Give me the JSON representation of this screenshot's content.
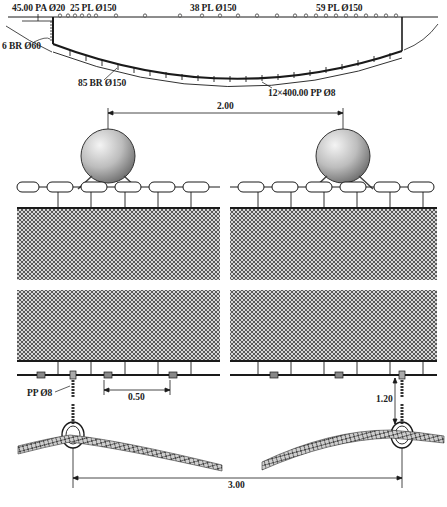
{
  "overview": {
    "headline_label": "45.00 PA Ø20",
    "float_labels": [
      "25 PL Ø150",
      "38 PL Ø150",
      "59 PL Ø150"
    ],
    "wing_sinker_label": "6 BR Ø60",
    "sinker_label": "85 BR Ø150",
    "purse_ring_label": "12×400.00 PP Ø8"
  },
  "detail": {
    "float_spacing": "2.00",
    "sinker_spacing": "0.50",
    "bridle_label": "PP Ø8",
    "bridle_length": "1.20",
    "ring_spacing": "3.00"
  },
  "colors": {
    "line": "#1a1a1a",
    "net_fill": "#8a8a8a",
    "float_light": "#f2f2f2",
    "float_dark": "#7a7a7a",
    "background": "#ffffff"
  }
}
